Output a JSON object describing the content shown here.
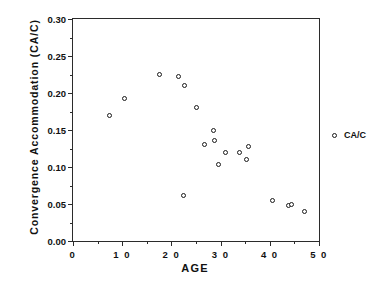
{
  "chart_data": {
    "type": "scatter",
    "title": "",
    "xlabel": "AGE",
    "ylabel": "Convergence  Accommodation  (CA/C)",
    "xlim": [
      0,
      50
    ],
    "ylim": [
      0.0,
      0.3
    ],
    "grid": false,
    "legend_position": "right-outside",
    "series": [
      {
        "name": "CA/C",
        "marker": "open-circle",
        "color": "#1a1a1a",
        "points": [
          {
            "x": 7.5,
            "y": 0.17
          },
          {
            "x": 10.5,
            "y": 0.193
          },
          {
            "x": 17.5,
            "y": 0.225
          },
          {
            "x": 21.5,
            "y": 0.222
          },
          {
            "x": 22.7,
            "y": 0.21
          },
          {
            "x": 22.5,
            "y": 0.062
          },
          {
            "x": 25.0,
            "y": 0.18
          },
          {
            "x": 26.8,
            "y": 0.13
          },
          {
            "x": 28.5,
            "y": 0.15
          },
          {
            "x": 28.8,
            "y": 0.136
          },
          {
            "x": 31.0,
            "y": 0.12
          },
          {
            "x": 33.8,
            "y": 0.12
          },
          {
            "x": 35.6,
            "y": 0.128
          },
          {
            "x": 29.5,
            "y": 0.103
          },
          {
            "x": 35.2,
            "y": 0.11
          },
          {
            "x": 40.5,
            "y": 0.055
          },
          {
            "x": 43.8,
            "y": 0.048
          },
          {
            "x": 44.5,
            "y": 0.05
          },
          {
            "x": 47.0,
            "y": 0.04
          }
        ]
      }
    ],
    "yticks_major": [
      "0.00",
      "0.05",
      "0.10",
      "0.15",
      "0.20",
      "0.25",
      "0.30"
    ],
    "yticks_major_values": [
      0.0,
      0.05,
      0.1,
      0.15,
      0.2,
      0.25,
      0.3
    ],
    "yticks_minor_values": [
      0.025,
      0.075,
      0.125,
      0.175,
      0.225,
      0.275
    ],
    "xticks_major": [
      "0",
      "1 0",
      "2 0",
      "3 0",
      "4 0",
      "5 0"
    ],
    "xticks_major_values": [
      0,
      10,
      20,
      30,
      40,
      50
    ],
    "xticks_minor_values": [
      5,
      15,
      25,
      35,
      45
    ]
  },
  "legend": {
    "entries": [
      {
        "label": "CA/C",
        "marker": "open-circle"
      }
    ]
  }
}
